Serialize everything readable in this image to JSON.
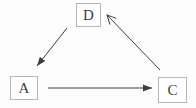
{
  "diagram": {
    "nodes": [
      {
        "id": "D",
        "label": "D"
      },
      {
        "id": "A",
        "label": "A"
      },
      {
        "id": "C",
        "label": "C"
      }
    ],
    "edges": [
      {
        "from": "D",
        "to": "A",
        "arrowhead": "filled"
      },
      {
        "from": "A",
        "to": "C",
        "arrowhead": "filled"
      },
      {
        "from": "C",
        "to": "D",
        "arrowhead": "open"
      }
    ],
    "colors": {
      "background": "#fdfdfd",
      "box_border": "#b5b5b5",
      "box_fill": "#ffffff",
      "label_text": "#3d3d3d",
      "arrow": "#3d3d3d"
    }
  }
}
